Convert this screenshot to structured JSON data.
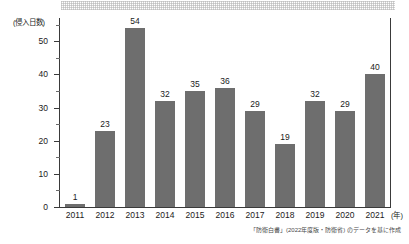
{
  "chart_data": {
    "type": "bar",
    "title": "",
    "subtitle": "",
    "xlabel": "(年)",
    "ylabel": "(侵入日数)",
    "categories": [
      "2011",
      "2012",
      "2013",
      "2014",
      "2015",
      "2016",
      "2017",
      "2018",
      "2019",
      "2020",
      "2021"
    ],
    "values": [
      1,
      23,
      54,
      32,
      35,
      36,
      29,
      19,
      32,
      29,
      40
    ],
    "value_labels": [
      "1",
      "23",
      "54",
      "32",
      "35",
      "36",
      "29",
      "19",
      "32",
      "29",
      "40"
    ],
    "ylim": [
      0,
      57
    ],
    "y_ticks_major": [
      0,
      10,
      20,
      30,
      40,
      50
    ],
    "y_tick_labels": [
      "0",
      "10",
      "20",
      "30",
      "40",
      "50"
    ],
    "y_ticks_minor": [
      5,
      15,
      25,
      35,
      45,
      55
    ],
    "grid": false,
    "legend": "none",
    "bar_color": "#6e6e6e",
    "axis_color": "#3a3a3a",
    "background_color": "#ffffff"
  },
  "annotations": {
    "source_note": "「防衛白書」(2022年度版・防衛省) のデータを基に作成"
  },
  "decoration": {
    "top_band_name": "halftone-band"
  }
}
